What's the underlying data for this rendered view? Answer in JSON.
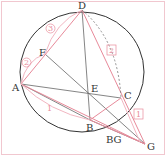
{
  "diagram": {
    "points": {
      "A": {
        "label": "A",
        "x": 21,
        "y": 84
      },
      "B": {
        "label": "B",
        "x": 90,
        "y": 120
      },
      "C": {
        "label": "C",
        "x": 121,
        "y": 98
      },
      "D": {
        "label": "D",
        "x": 82,
        "y": 10
      },
      "E": {
        "label": "E",
        "x": 89,
        "y": 94
      },
      "F": {
        "label": "F",
        "x": 45,
        "y": 54
      },
      "G": {
        "label": "G",
        "x": 145,
        "y": 144
      }
    },
    "segment_labels": {
      "bg": "BG",
      "one_top": "1",
      "one_bottom": "1",
      "two_left": "2",
      "two_right": "2",
      "three": "3"
    },
    "colors": {
      "circle": "#333333",
      "black_line": "#555555",
      "pink_line": "#e88a9a",
      "frame": "#f1c7cf"
    }
  }
}
